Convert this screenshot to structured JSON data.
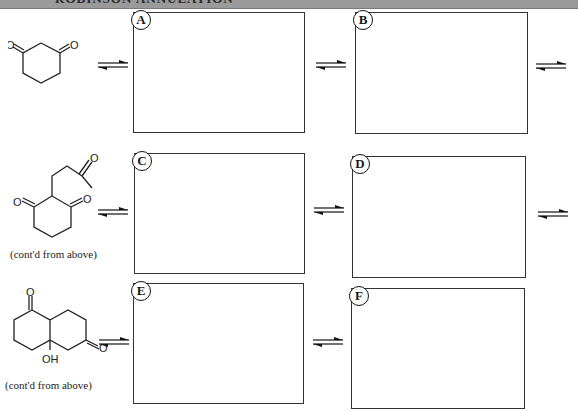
{
  "header": {
    "title": "ROBINSON ANNULATION",
    "bar_color": "#9a9a9a"
  },
  "rows": [
    {
      "start_molecule": {
        "name": "1,3-cyclohexanedione",
        "caption": ""
      },
      "boxes": [
        {
          "label": "A"
        },
        {
          "label": "B"
        }
      ]
    },
    {
      "start_molecule": {
        "name": "2-(3-oxobutyl)cyclohexane-1,3-dione",
        "caption": "(cont'd from above)"
      },
      "boxes": [
        {
          "label": "C"
        },
        {
          "label": "D"
        }
      ]
    },
    {
      "start_molecule": {
        "name": "bicyclic aldol product (hydroxy diketone)",
        "caption": "(cont'd from above)",
        "atom_label_oh": "OH",
        "atom_label_o": "O"
      },
      "boxes": [
        {
          "label": "E"
        },
        {
          "label": "F"
        }
      ]
    }
  ],
  "atoms": {
    "oxygen": "O",
    "hydroxyl": "OH"
  },
  "arrow_icon": "equilibrium-arrows-icon"
}
